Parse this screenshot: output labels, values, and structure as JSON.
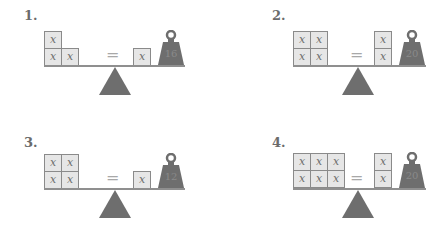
{
  "problems": [
    {
      "label": "1.",
      "left_blocks": {
        "rows": [
          [
            "x"
          ],
          [
            "x",
            "x"
          ]
        ]
      },
      "equals": "=",
      "right_blocks": {
        "rows": [
          [
            "x"
          ]
        ]
      },
      "weight": "16"
    },
    {
      "label": "2.",
      "left_blocks": {
        "rows": [
          [
            "x",
            "x"
          ],
          [
            "x",
            "x"
          ]
        ]
      },
      "equals": "=",
      "right_blocks": {
        "rows": [
          [
            "x"
          ],
          [
            "x"
          ]
        ]
      },
      "weight": "20"
    },
    {
      "label": "3.",
      "left_blocks": {
        "rows": [
          [
            "x",
            "x"
          ],
          [
            "x",
            "x"
          ]
        ]
      },
      "equals": "=",
      "right_blocks": {
        "rows": [
          [
            "x"
          ]
        ]
      },
      "weight": "12"
    },
    {
      "label": "4.",
      "left_blocks": {
        "rows": [
          [
            "x",
            "x",
            "x"
          ],
          [
            "x",
            "x",
            "x"
          ]
        ]
      },
      "equals": "=",
      "right_blocks": {
        "rows": [
          [
            "x"
          ],
          [
            "x"
          ]
        ]
      },
      "weight": "20"
    }
  ],
  "colors": {
    "block_fill": "#e6e6e6",
    "block_border": "#8a8a8a",
    "fulcrum": "#6e6e6e",
    "weight": "#6e6e6e",
    "label": "#6b6b6b"
  }
}
